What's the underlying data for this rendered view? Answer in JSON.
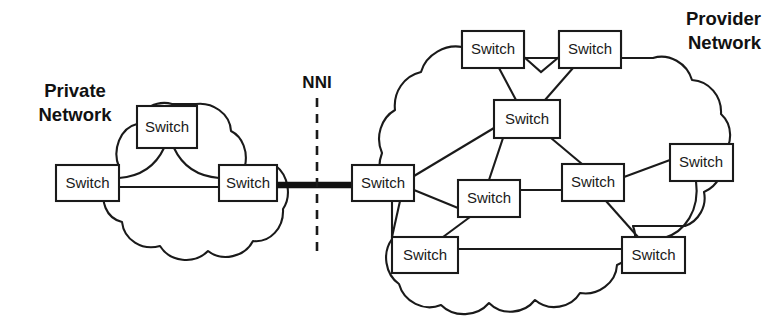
{
  "figure": {
    "type": "network-diagram",
    "background": "#ffffff",
    "stroke_color": "#1a1a1a",
    "width": 774,
    "height": 324
  },
  "labels": {
    "private_network_line1": "Private",
    "private_network_line2": "Network",
    "provider_network_line1": "Provider",
    "provider_network_line2": "Network",
    "nni": "NNI"
  },
  "nodes": {
    "private": [
      {
        "id": "p-top",
        "label": "Switch",
        "x": 137,
        "y": 106,
        "w": 60,
        "h": 42
      },
      {
        "id": "p-left",
        "label": "Switch",
        "x": 56,
        "y": 165,
        "w": 63,
        "h": 36
      },
      {
        "id": "p-right",
        "label": "Switch",
        "x": 219,
        "y": 165,
        "w": 58,
        "h": 36
      }
    ],
    "provider": [
      {
        "id": "v-edge",
        "label": "Switch",
        "x": 352,
        "y": 165,
        "w": 62,
        "h": 36
      },
      {
        "id": "v-top-l",
        "label": "Switch",
        "x": 462,
        "y": 31,
        "w": 62,
        "h": 37
      },
      {
        "id": "v-top-r",
        "label": "Switch",
        "x": 559,
        "y": 31,
        "w": 62,
        "h": 37
      },
      {
        "id": "v-core",
        "label": "Switch",
        "x": 494,
        "y": 100,
        "w": 66,
        "h": 38
      },
      {
        "id": "v-mid-l",
        "label": "Switch",
        "x": 458,
        "y": 180,
        "w": 62,
        "h": 37
      },
      {
        "id": "v-mid-r",
        "label": "Switch",
        "x": 562,
        "y": 164,
        "w": 62,
        "h": 37
      },
      {
        "id": "v-right",
        "label": "Switch",
        "x": 670,
        "y": 144,
        "w": 63,
        "h": 37
      },
      {
        "id": "v-bot-l",
        "label": "Switch",
        "x": 392,
        "y": 237,
        "w": 66,
        "h": 36
      },
      {
        "id": "v-bot-r",
        "label": "Switch",
        "x": 622,
        "y": 237,
        "w": 63,
        "h": 36
      }
    ]
  },
  "links": {
    "private": [
      {
        "from": "p-left",
        "to": "p-right",
        "style": "straight"
      },
      {
        "from": "p-left",
        "to": "p-top",
        "style": "curve"
      },
      {
        "from": "p-top",
        "to": "p-right",
        "style": "curve"
      }
    ],
    "interconnect": [
      {
        "from": "p-right",
        "to": "v-edge",
        "style": "trunk"
      }
    ],
    "provider": [
      {
        "from": "v-top-l",
        "to": "v-top-r",
        "style": "v-bend"
      },
      {
        "from": "v-top-l",
        "to": "v-core",
        "style": "straight"
      },
      {
        "from": "v-top-r",
        "to": "v-core",
        "style": "straight"
      },
      {
        "from": "v-edge",
        "to": "v-core",
        "style": "straight"
      },
      {
        "from": "v-edge",
        "to": "v-mid-l",
        "style": "straight"
      },
      {
        "from": "v-edge",
        "to": "v-bot-l",
        "style": "straight"
      },
      {
        "from": "v-core",
        "to": "v-mid-l",
        "style": "straight"
      },
      {
        "from": "v-core",
        "to": "v-mid-r",
        "style": "straight"
      },
      {
        "from": "v-mid-l",
        "to": "v-mid-r",
        "style": "straight"
      },
      {
        "from": "v-mid-l",
        "to": "v-bot-l",
        "style": "straight"
      },
      {
        "from": "v-mid-r",
        "to": "v-right",
        "style": "straight"
      },
      {
        "from": "v-mid-r",
        "to": "v-bot-r",
        "style": "straight"
      },
      {
        "from": "v-right",
        "to": "v-bot-r",
        "style": "curve"
      },
      {
        "from": "v-bot-l",
        "to": "v-bot-r",
        "style": "straight"
      }
    ]
  },
  "nni_divider": {
    "x": 317,
    "y_top": 98,
    "y_bottom": 258
  }
}
